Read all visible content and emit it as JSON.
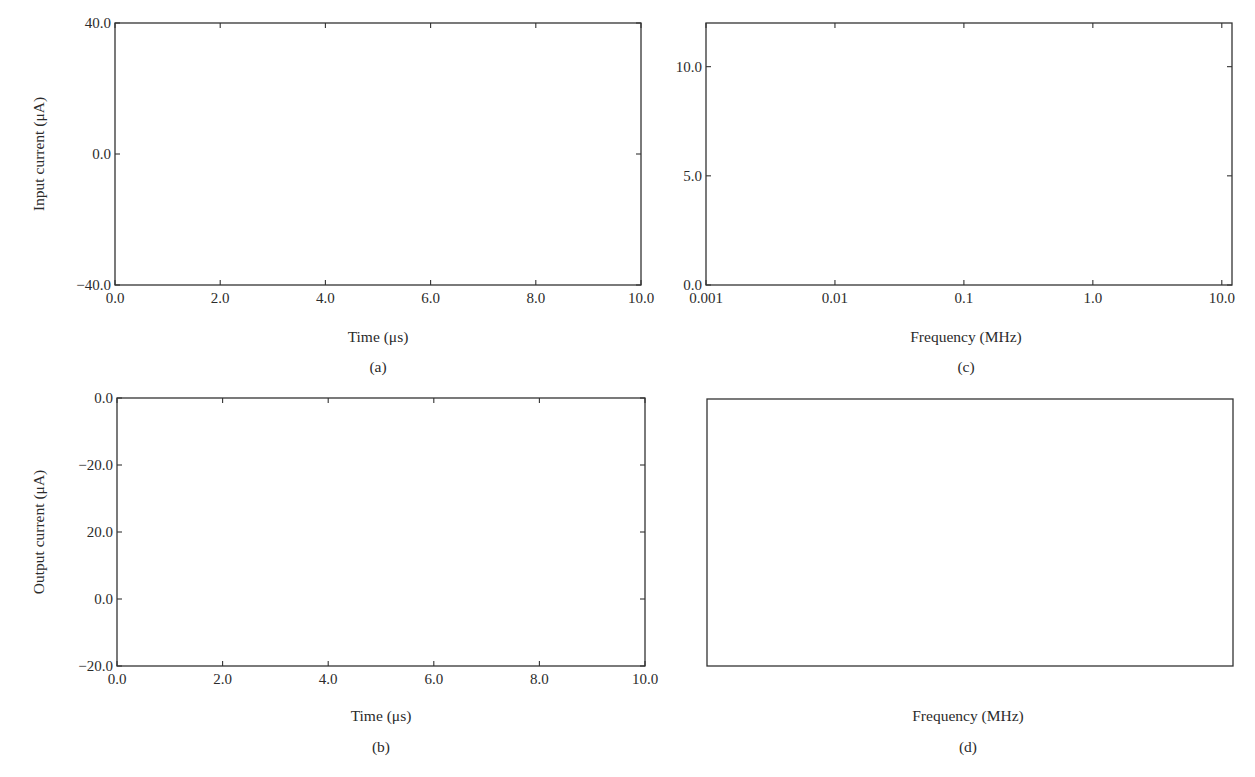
{
  "figure": {
    "panels": [
      {
        "id": "a",
        "caption": "(a)",
        "xlabel": "Time (μs)",
        "ylabel": "Input current (μA)",
        "xticks": [
          "0.0",
          "2.0",
          "4.0",
          "6.0",
          "8.0",
          "10.0"
        ],
        "yticks": [
          "40.0",
          "0.0",
          "−40.0"
        ]
      },
      {
        "id": "b",
        "caption": "(b)",
        "xlabel": "Time (μs)",
        "ylabel": "Output current (μA)",
        "xticks": [
          "0.0",
          "2.0",
          "4.0",
          "6.0",
          "8.0",
          "10.0"
        ],
        "yticks": [
          "0.0",
          "−20.0",
          "20.0",
          "0.0",
          "−20.0"
        ]
      },
      {
        "id": "c",
        "caption": "(c)",
        "xlabel": "Frequency (MHz)",
        "ylabel": "",
        "xticks": [
          "0.001",
          "0.01",
          "0.1",
          "1.0",
          "10.0"
        ],
        "yticks": [
          "10.0",
          "5.0",
          "0.0"
        ]
      },
      {
        "id": "d",
        "caption": "(d)",
        "xlabel": "Frequency (MHz)",
        "ylabel": "",
        "xticks": [
          "0.001",
          "0.01",
          "0.1",
          "1.0",
          "10.0"
        ],
        "yticks": [
          "10.0",
          "5.0",
          "0.0",
          "10.0",
          "5.0",
          "0.0"
        ]
      }
    ]
  },
  "chart_data": [
    {
      "panel": "a",
      "type": "line",
      "title": "",
      "xlabel": "Time (μs)",
      "ylabel": "Input current (μA)",
      "xlim": [
        0,
        10
      ],
      "ylim": [
        -40,
        40
      ],
      "x_tick_values": [
        0,
        2,
        4,
        6,
        8,
        10
      ],
      "y_tick_values": [
        40,
        0,
        -40
      ],
      "grid": false,
      "description": "Sum of sinusoids: 0.1 MHz, 0.5 MHz, 1 MHz and 10 MHz components",
      "components": [
        {
          "freq_mhz": 0.1,
          "amplitude": 10,
          "phase": 0
        },
        {
          "freq_mhz": 0.5,
          "amplitude": 4,
          "phase": 0
        },
        {
          "freq_mhz": 1.0,
          "amplitude": 10,
          "phase": 0
        },
        {
          "freq_mhz": 10.0,
          "amplitude": 10,
          "phase": 0
        }
      ],
      "offset": 0,
      "key_points": {
        "max": [
          2.3,
          37
        ],
        "min": [
          7.7,
          -38
        ],
        "start": [
          0,
          5
        ],
        "end": [
          10,
          0
        ]
      }
    },
    {
      "panel": "b",
      "type": "line",
      "title": "",
      "xlabel": "Time (μs)",
      "ylabel": "Output current (μA)",
      "xlim": [
        0,
        10
      ],
      "ylim": [
        -20,
        60
      ],
      "x_tick_values": [
        0,
        2,
        4,
        6,
        8,
        10
      ],
      "y_tick_values": [
        60,
        40,
        20,
        0,
        -20
      ],
      "y_tick_labels_shown": [
        "0.0",
        "−20.0",
        "20.0",
        "0.0",
        "−20.0"
      ],
      "grid": false,
      "components": [
        {
          "freq_mhz": 0.5,
          "amplitude": 6,
          "phase": 0
        },
        {
          "freq_mhz": 1.0,
          "amplitude": 20,
          "phase": 0
        }
      ],
      "offset": 20,
      "key_points": {
        "peak_high": [
          0.27,
          44
        ],
        "peak_low": [
          1.25,
          36
        ],
        "trough_shallow": [
          0.77,
          4.5
        ],
        "trough_deep": [
          1.75,
          -4.2
        ]
      }
    },
    {
      "panel": "c",
      "type": "line",
      "title": "",
      "xlabel": "Frequency (MHz)",
      "ylabel": "",
      "xscale": "log",
      "xlim": [
        0.001,
        12
      ],
      "ylim": [
        0,
        12
      ],
      "x_tick_values": [
        0.001,
        0.01,
        0.1,
        1,
        10
      ],
      "y_tick_values": [
        10,
        5,
        0
      ],
      "grid": false,
      "x": [
        0.001,
        0.05,
        0.1,
        0.15,
        0.45,
        0.5,
        0.55,
        0.95,
        1.0,
        1.05,
        9.9,
        10.0,
        10.1,
        12
      ],
      "y": [
        0,
        0,
        10,
        0,
        0,
        9.9,
        0,
        0,
        9.9,
        0,
        0,
        9.45,
        0,
        0
      ],
      "peaks": [
        {
          "freq_mhz": 0.1,
          "magnitude": 10.0
        },
        {
          "freq_mhz": 0.5,
          "magnitude": 9.9
        },
        {
          "freq_mhz": 1.0,
          "magnitude": 9.9
        },
        {
          "freq_mhz": 10.0,
          "magnitude": 9.45
        }
      ]
    },
    {
      "panel": "d",
      "type": "line",
      "title": "",
      "xlabel": "Frequency (MHz)",
      "ylabel": "",
      "xscale": "log",
      "xlim": [
        0.001,
        12
      ],
      "ylim": [
        0,
        25
      ],
      "y_tick_labels_shown": [
        "10.0",
        "5.0",
        "0.0",
        "10.0",
        "5.0",
        "0.0"
      ],
      "y_tick_values": [
        25,
        20,
        15,
        10,
        5,
        0
      ],
      "grid": false,
      "x": [
        0.001,
        0.46,
        0.5,
        0.54,
        0.96,
        1.0,
        1.04,
        12
      ],
      "y": [
        0,
        0,
        7.5,
        0,
        0,
        25,
        0,
        0
      ],
      "peaks": [
        {
          "freq_mhz": 0.5,
          "magnitude": 7.5
        },
        {
          "freq_mhz": 1.0,
          "magnitude": 25
        }
      ]
    }
  ]
}
